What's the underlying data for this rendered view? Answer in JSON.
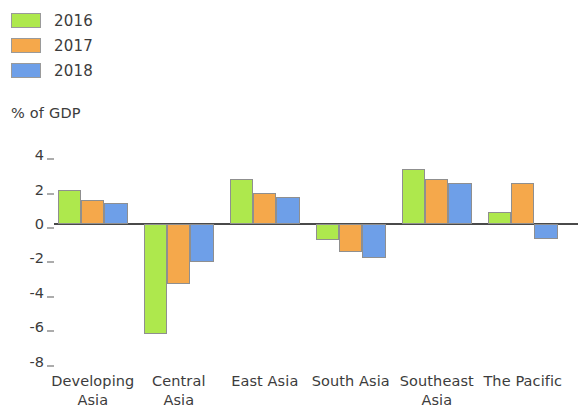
{
  "legend": {
    "items": [
      {
        "label": "2016",
        "color": "#aee84d"
      },
      {
        "label": "2017",
        "color": "#f5a84b"
      },
      {
        "label": "2018",
        "color": "#6e9fe8"
      }
    ]
  },
  "axis": {
    "unit_caption": "% of GDP"
  },
  "chart_data": {
    "type": "bar",
    "title": "",
    "subtitle": "",
    "xlabel": "",
    "ylabel": "% of GDP",
    "ylim": [
      -8,
      4
    ],
    "yticks": [
      4,
      2,
      0,
      -2,
      -4,
      -6,
      -8
    ],
    "ytick_labels": [
      "4",
      "2",
      "0",
      "-2",
      "-4",
      "-6",
      "-8"
    ],
    "grid": false,
    "legend_position": "top-left",
    "categories": [
      "Developing Asia",
      "Central Asia",
      "East Asia",
      "South Asia",
      "Southeast Asia",
      "The Pacific"
    ],
    "category_lines": [
      [
        "Developing",
        "Asia"
      ],
      [
        "Central",
        "Asia"
      ],
      [
        "East Asia"
      ],
      [
        "South Asia"
      ],
      [
        "Southeast",
        "Asia"
      ],
      [
        "The Pacific"
      ]
    ],
    "series": [
      {
        "name": "2016",
        "color": "#aee84d",
        "values": [
          2.0,
          -6.4,
          2.6,
          -0.95,
          3.2,
          0.7
        ]
      },
      {
        "name": "2017",
        "color": "#f5a84b",
        "values": [
          1.4,
          -3.5,
          1.8,
          -1.65,
          2.6,
          2.4
        ]
      },
      {
        "name": "2018",
        "color": "#6e9fe8",
        "values": [
          1.2,
          -2.2,
          1.55,
          -1.95,
          2.4,
          -0.9
        ]
      }
    ]
  }
}
